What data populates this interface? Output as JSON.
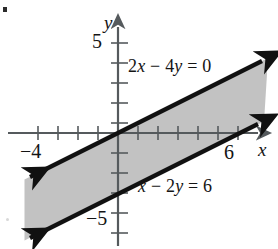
{
  "figure": {
    "bullet_marker": "•",
    "axes": {
      "x_label": "x",
      "y_label": "y",
      "x_ticks_labeled": [
        {
          "value": -4,
          "text": "−4"
        },
        {
          "value": 6,
          "text": "6"
        }
      ],
      "y_ticks_labeled": [
        {
          "value": 5,
          "text": "5"
        },
        {
          "value": -5,
          "text": "−5"
        }
      ]
    },
    "labels": {
      "upper_line_eq_html": "2<i>x</i> − 4<i>y</i> = 0",
      "lower_line_eq_html": "<i>x</i> − 2<i>y</i> = 6",
      "y_axis_name": "y",
      "x_axis_name": "x",
      "tick_5": "5",
      "tick_neg5": "−5",
      "tick_neg4": "−4",
      "tick_6": "6"
    },
    "colors": {
      "shade": "#bdbdbd",
      "boundary": "#111111",
      "axis": "#555a5d",
      "background": "#ffffff",
      "text": "#141414"
    }
  },
  "chart_data": {
    "type": "line",
    "title": "",
    "xlabel": "x",
    "ylabel": "y",
    "xlim": [
      -5.9,
      7.75
    ],
    "ylim": [
      -5.65,
      5.4
    ],
    "grid": false,
    "legend": "none",
    "tick_step": 1,
    "series": [
      {
        "name": "2x − 4y = 0",
        "equation": "2x - 4y = 0",
        "slope": 0.5,
        "intercept": 0,
        "style": "solid",
        "arrows": "both",
        "points": [
          [
            -4.65,
            -2.325
          ],
          [
            7.35,
            3.675
          ]
        ]
      },
      {
        "name": "x − 2y = 6",
        "equation": "x - 2y = 6",
        "slope": 0.5,
        "intercept": -3,
        "style": "solid",
        "arrows": "both",
        "points": [
          [
            -4.65,
            -5.325
          ],
          [
            7.2,
            0.6
          ]
        ]
      }
    ],
    "shaded_region": {
      "description": "Band between the two parallel lines (solution set of the system)",
      "between": [
        "2x − 4y = 0",
        "x − 2y = 6"
      ],
      "fill": "#bdbdbd"
    },
    "annotations": [
      {
        "text": "2x − 4y = 0",
        "x": 0.6,
        "y": 3.55
      },
      {
        "text": "x − 2y = 6",
        "x": 1.3,
        "y": -2.45
      }
    ]
  }
}
